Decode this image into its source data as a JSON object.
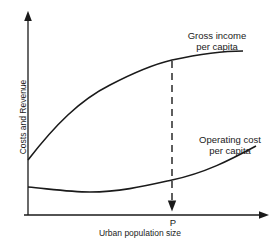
{
  "diagram": {
    "y_axis_label": "Costs and Revenue",
    "x_axis_label": "Urban population size",
    "marker_label": "P",
    "curves": [
      {
        "name": "gross-income",
        "label_line1": "Gross income",
        "label_line2": "per capita"
      },
      {
        "name": "operating-cost",
        "label_line1": "Operating cost",
        "label_line2": "per capita"
      }
    ],
    "line_color": "#1a1a1a"
  }
}
